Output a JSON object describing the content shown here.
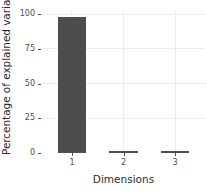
{
  "chart_data": {
    "type": "bar",
    "title": "",
    "subtitle": "",
    "xlabel": "Dimensions",
    "ylabel": "Percentage of explained variances",
    "categories": [
      "1",
      "2",
      "3"
    ],
    "values": [
      98.0,
      1.1,
      0.9
    ],
    "xlim": [
      0.4,
      3.6
    ],
    "ylim": [
      0,
      103
    ],
    "y_ticks": [
      "0",
      "25",
      "50",
      "75",
      "100"
    ],
    "y_tick_values": [
      0,
      25,
      50,
      75,
      100
    ],
    "x_ticks": [
      "1",
      "2",
      "3"
    ],
    "grid": true,
    "grid_major_horizontal": true,
    "grid_major_vertical": true,
    "legend": "none",
    "series": [
      {
        "name": "Percentage of explained variances",
        "values": [
          98.0,
          1.1,
          0.9
        ]
      }
    ]
  },
  "style": {
    "bar_color": "#4d4d4d",
    "grid_color": "#ececec",
    "panel_background": "#ffffff",
    "text_color": "#2b2b2b",
    "tick_color": "#4d4d4d"
  }
}
